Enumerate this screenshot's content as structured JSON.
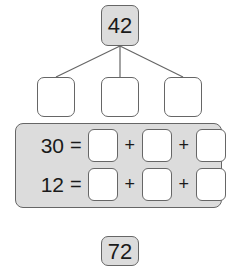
{
  "diagram": {
    "root_value": "42",
    "branches": [
      "",
      "",
      ""
    ],
    "equations": [
      {
        "total": "30",
        "equals": "=",
        "operator": "+",
        "cells": [
          "",
          "",
          ""
        ]
      },
      {
        "total": "12",
        "equals": "=",
        "operator": "+",
        "cells": [
          "",
          "",
          ""
        ]
      }
    ],
    "next_root_value": "72"
  }
}
